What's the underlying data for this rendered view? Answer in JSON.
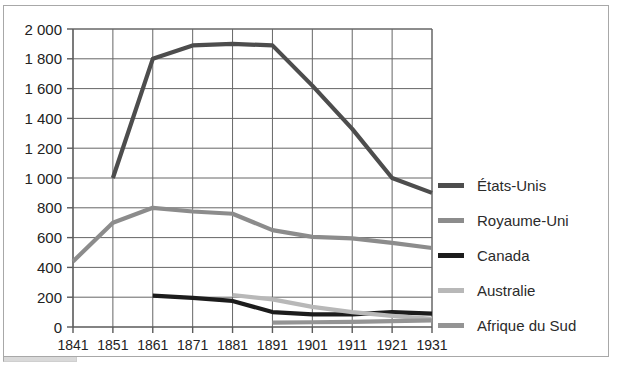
{
  "chart_data": {
    "type": "line",
    "title": "",
    "xlabel": "",
    "ylabel": "",
    "xlim": [
      1841,
      1931
    ],
    "ylim": [
      0,
      2000
    ],
    "ytick_step": 200,
    "grid": true,
    "legend_position": "right",
    "categories": [
      1841,
      1851,
      1861,
      1871,
      1881,
      1891,
      1901,
      1911,
      1921,
      1931
    ],
    "xtick_labels": [
      "1841",
      "1851",
      "1861",
      "1871",
      "1881",
      "1891",
      "1901",
      "1911",
      "1921",
      "1931"
    ],
    "ytick_labels": [
      "0",
      "200",
      "400",
      "600",
      "800",
      "1 000",
      "1 200",
      "1 400",
      "1 600",
      "1 800",
      "2 000"
    ],
    "ytick_values": [
      0,
      200,
      400,
      600,
      800,
      1000,
      1200,
      1400,
      1600,
      1800,
      2000
    ],
    "series": [
      {
        "name": "États-Unis",
        "color": "#4d4d4d",
        "x": [
          1851,
          1861,
          1871,
          1881,
          1891,
          1901,
          1911,
          1921,
          1931
        ],
        "values": [
          1000,
          1800,
          1890,
          1900,
          1890,
          1620,
          1330,
          1000,
          900
        ]
      },
      {
        "name": "Royaume-Uni",
        "color": "#8c8c8c",
        "x": [
          1841,
          1851,
          1861,
          1871,
          1881,
          1891,
          1901,
          1911,
          1921,
          1931
        ],
        "values": [
          440,
          700,
          800,
          775,
          760,
          650,
          605,
          595,
          565,
          530
        ]
      },
      {
        "name": "Canada",
        "color": "#1c1c1c",
        "x": [
          1861,
          1871,
          1881,
          1891,
          1901,
          1911,
          1921,
          1931
        ],
        "values": [
          210,
          195,
          175,
          100,
          85,
          85,
          100,
          90
        ]
      },
      {
        "name": "Australie",
        "color": "#b8b8b8",
        "x": [
          1881,
          1891,
          1901,
          1911,
          1921,
          1931
        ],
        "values": [
          215,
          185,
          135,
          100,
          75,
          55
        ]
      },
      {
        "name": "Afrique du Sud",
        "color": "#949494",
        "x": [
          1891,
          1901,
          1911,
          1921,
          1931
        ],
        "values": [
          30,
          32,
          35,
          40,
          45
        ]
      }
    ]
  },
  "legend": {
    "items": [
      {
        "label": "États-Unis",
        "color": "#4d4d4d"
      },
      {
        "label": "Royaume-Uni",
        "color": "#8c8c8c"
      },
      {
        "label": "Canada",
        "color": "#1c1c1c"
      },
      {
        "label": "Australie",
        "color": "#b8b8b8"
      },
      {
        "label": "Afrique du Sud",
        "color": "#949494"
      }
    ]
  },
  "style": {
    "grid_color": "#666666",
    "axis_color": "#5a5a5a",
    "frame_color": "#a8a8a8",
    "background": "#ffffff",
    "text_color": "#222222"
  }
}
